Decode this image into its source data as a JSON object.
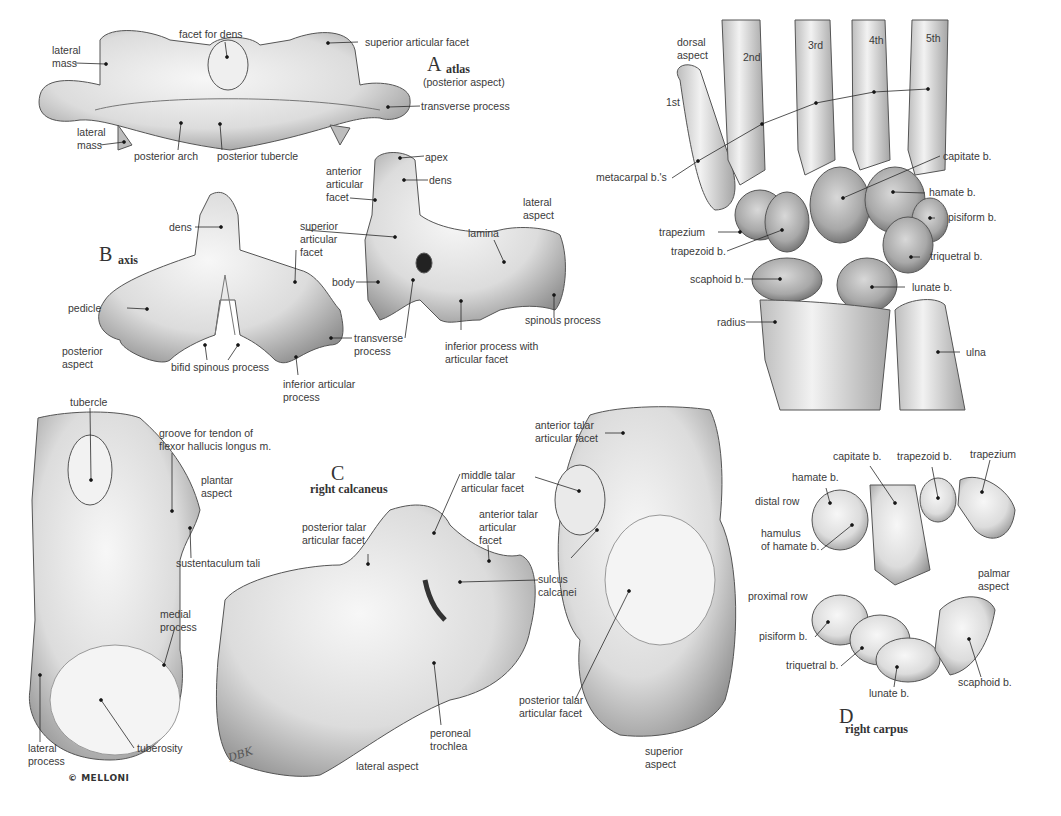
{
  "panels": {
    "A": {
      "letter": "A",
      "title": "atlas",
      "subtitle": "(posterior aspect)",
      "labels": {
        "facet_for_dens": "facet for dens",
        "superior_articular_facet": "superior articular facet",
        "lateral_mass_top": "lateral\nmass",
        "lateral_mass_bottom": "lateral\nmass",
        "transverse_process": "transverse process",
        "posterior_arch": "posterior arch",
        "posterior_tubercle": "posterior tubercle"
      }
    },
    "B": {
      "letter": "B",
      "title": "axis",
      "labels": {
        "dens": "dens",
        "superior_articular_facet": "superior\narticular\nfacet",
        "pedicle": "pedicle",
        "posterior_aspect": "posterior\naspect",
        "bifid_spinous_process": "bifid spinous process",
        "inferior_articular_process": "inferior articular\nprocess",
        "transverse_process": "transverse\nprocess",
        "apex": "apex",
        "dens_lateral": "dens",
        "anterior_articular_facet": "anterior\narticular\nfacet",
        "lateral_aspect": "lateral\naspect",
        "lamina": "lamina",
        "body": "body",
        "spinous_process": "spinous process",
        "inferior_process": "inferior process with\narticular facet"
      }
    },
    "hand": {
      "labels": {
        "dorsal_aspect": "dorsal\naspect",
        "mc1": "1st",
        "mc2": "2nd",
        "mc3": "3rd",
        "mc4": "4th",
        "mc5": "5th",
        "metacarpals": "metacarpal b.'s",
        "capitate": "capitate b.",
        "hamate": "hamate b.",
        "pisiform": "pisiform b.",
        "trapezium": "trapezium",
        "trapezoid": "trapezoid b.",
        "triquetral": "triquetral b.",
        "scaphoid": "scaphoid b.",
        "lunate": "lunate b.",
        "radius": "radius",
        "ulna": "ulna"
      }
    },
    "C": {
      "letter": "C",
      "title": "right calcaneus",
      "labels": {
        "tubercle": "tubercle",
        "groove": "groove for tendon of\nflexor hallucis longus m.",
        "plantar_aspect": "plantar\naspect",
        "sustentaculum_tali": "sustentaculum tali",
        "medial_process": "medial\nprocess",
        "lateral_process": "lateral\nprocess",
        "tuberosity": "tuberosity",
        "posterior_talar_facet": "posterior talar\narticular facet",
        "middle_talar_facet": "middle talar\narticular facet",
        "anterior_talar_facet": "anterior talar\narticular\nfacet",
        "sulcus_calcanei": "sulcus\ncalcanei",
        "peroneal_trochlea": "peroneal\ntrochlea",
        "lateral_aspect": "lateral aspect",
        "anterior_talar_facet_sup": "anterior talar\narticular facet",
        "posterior_talar_facet_sup": "posterior talar\narticular facet",
        "superior_aspect": "superior\naspect"
      }
    },
    "D": {
      "letter": "D",
      "title": "right carpus",
      "labels": {
        "capitate": "capitate b.",
        "trapezoid": "trapezoid b.",
        "trapezium": "trapezium",
        "hamate": "hamate b.",
        "distal_row": "distal row",
        "hamulus": "hamulus\nof hamate b.",
        "palmar_aspect": "palmar\naspect",
        "proximal_row": "proximal row",
        "pisiform": "pisiform b.",
        "triquetral": "triquetral b.",
        "lunate": "lunate b.",
        "scaphoid": "scaphoid b."
      }
    }
  },
  "credits": {
    "copyright": "© MELLONI",
    "signature": "DBK"
  },
  "colors": {
    "bone_fill": "#e4e4e4",
    "bone_shadow": "#9a9a9a",
    "line": "#2a2a2a",
    "text": "#3a3a3a"
  }
}
